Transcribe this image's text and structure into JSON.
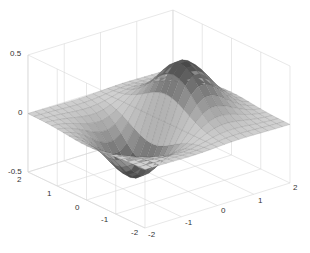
{
  "chart_data": {
    "type": "surface3d",
    "title": "",
    "function": "z = x * exp(-x^2 - y^2)",
    "x": {
      "label": "",
      "range": [
        -2,
        2
      ],
      "ticks": [
        -2,
        -1,
        0,
        1,
        2
      ]
    },
    "y": {
      "label": "",
      "range": [
        -2,
        2
      ],
      "ticks": [
        -2,
        -1,
        0,
        1,
        2
      ]
    },
    "z": {
      "label": "",
      "range": [
        -0.5,
        0.5
      ],
      "ticks": [
        -0.5,
        0,
        0.5
      ]
    },
    "grid": true,
    "grid_step": 0.2,
    "max": {
      "x": 0.71,
      "y": 0,
      "z": 0.43
    },
    "min": {
      "x": -0.71,
      "y": 0,
      "z": -0.43
    },
    "colormap": "gray",
    "view": "default 3D (az -37.5, el 30)"
  },
  "labels": {
    "z_ticks": [
      "0.5",
      "0",
      "-0.5"
    ],
    "y_ticks": [
      "2",
      "1",
      "0",
      "-1",
      "-2"
    ],
    "x_ticks": [
      "-2",
      "-1",
      "0",
      "1",
      "2"
    ]
  },
  "colors": {
    "background": "#ffffff",
    "gridline": "#d8d8d8",
    "surface_light": "#d8d8d8",
    "surface_dark": "#3a3a3a",
    "edge": "#555555"
  }
}
